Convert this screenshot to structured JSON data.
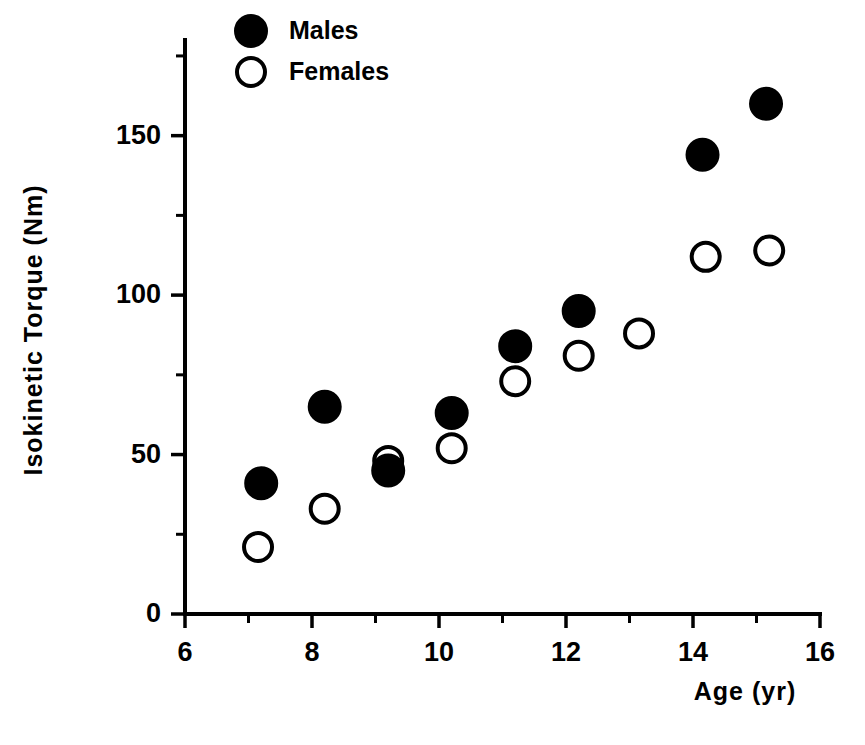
{
  "chart_data": {
    "type": "scatter",
    "title": "",
    "xlabel": "Age  (yr)",
    "ylabel": "Isokinetic  Torque  (Nm)",
    "xlim": [
      6,
      16
    ],
    "ylim": [
      0,
      180
    ],
    "grid": false,
    "legend_position": "top-center",
    "x_ticks_major": [
      6,
      8,
      10,
      12,
      14,
      16
    ],
    "x_ticks_major_labels": [
      "6",
      "8",
      "10",
      "12",
      "14",
      "16"
    ],
    "x_ticks_minor": [
      7,
      9,
      11,
      13,
      15
    ],
    "y_ticks_major": [
      0,
      50,
      100,
      150
    ],
    "y_ticks_major_labels": [
      "0",
      "50",
      "100",
      "150"
    ],
    "y_ticks_minor": [
      25,
      75,
      125,
      175
    ],
    "series": [
      {
        "name": "Males",
        "marker": "filled-circle",
        "color": "#000000",
        "points": [
          {
            "x": 7.2,
            "y": 41
          },
          {
            "x": 8.2,
            "y": 65
          },
          {
            "x": 9.2,
            "y": 45
          },
          {
            "x": 10.2,
            "y": 63
          },
          {
            "x": 11.2,
            "y": 84
          },
          {
            "x": 12.2,
            "y": 95
          },
          {
            "x": 14.15,
            "y": 144
          },
          {
            "x": 15.15,
            "y": 160
          }
        ]
      },
      {
        "name": "Females",
        "marker": "open-circle",
        "color": "#000000",
        "points": [
          {
            "x": 7.15,
            "y": 21
          },
          {
            "x": 8.2,
            "y": 33
          },
          {
            "x": 9.2,
            "y": 48
          },
          {
            "x": 10.2,
            "y": 52
          },
          {
            "x": 11.2,
            "y": 73
          },
          {
            "x": 12.2,
            "y": 81
          },
          {
            "x": 13.15,
            "y": 88
          },
          {
            "x": 14.2,
            "y": 112
          },
          {
            "x": 15.2,
            "y": 114
          }
        ]
      }
    ]
  },
  "legend": {
    "entries": [
      {
        "label": "Males",
        "marker": "filled-circle"
      },
      {
        "label": "Females",
        "marker": "open-circle"
      }
    ]
  }
}
